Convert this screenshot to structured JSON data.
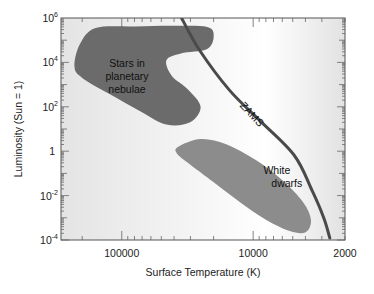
{
  "chart_data": {
    "type": "scatter",
    "title": "",
    "xlabel": "Surface Temperature   (K)",
    "ylabel": "Luminosity   (Sun = 1)",
    "xscale": "log",
    "yscale": "log",
    "x_reversed": true,
    "xlim": [
      290000,
      2000
    ],
    "ylim": [
      0.0001,
      1000000
    ],
    "x_ticks": [
      {
        "value": 100000,
        "label": "100000"
      },
      {
        "value": 10000,
        "label": "10000"
      },
      {
        "value": 2000,
        "label": "2000"
      }
    ],
    "y_ticks": [
      {
        "value": 1000000,
        "base": "10",
        "exp": "6"
      },
      {
        "value": 10000,
        "base": "10",
        "exp": "4"
      },
      {
        "value": 100,
        "base": "10",
        "exp": "2"
      },
      {
        "value": 1,
        "base": "1",
        "exp": ""
      },
      {
        "value": 0.01,
        "base": "10",
        "exp": "-2"
      },
      {
        "value": 0.0001,
        "base": "10",
        "exp": "-4"
      }
    ],
    "grid": false,
    "colors": {
      "planetary_nebulae": "#6b6b6b",
      "white_dwarfs": "#8c8c8c",
      "zams": "#4a4a4a",
      "background_edge": "#e6e6e6",
      "background_center": "#ffffff"
    },
    "regions": [
      {
        "name": "Stars in planetary nebulae",
        "label_lines": [
          "Stars in",
          "planetary",
          "nebulae"
        ],
        "label_at": [
          4.96,
          3.2
        ],
        "outline_logT_logL": [
          [
            5.2,
            5.55
          ],
          [
            4.9,
            5.62
          ],
          [
            4.6,
            5.65
          ],
          [
            4.35,
            5.6
          ],
          [
            4.3,
            5.2
          ],
          [
            4.35,
            4.6
          ],
          [
            4.55,
            4.4
          ],
          [
            4.66,
            4.1
          ],
          [
            4.62,
            3.4
          ],
          [
            4.5,
            2.8
          ],
          [
            4.4,
            2.0
          ],
          [
            4.48,
            1.3
          ],
          [
            4.66,
            1.2
          ],
          [
            4.86,
            1.8
          ],
          [
            5.1,
            2.6
          ],
          [
            5.3,
            3.3
          ],
          [
            5.36,
            3.8
          ],
          [
            5.32,
            4.8
          ]
        ]
      },
      {
        "name": "White dwarfs",
        "label_lines": [
          "White",
          "dwarfs"
        ],
        "label_at": [
          3.82,
          -1.3
        ],
        "outline_logT_logL": [
          [
            4.57,
            0.2
          ],
          [
            4.4,
            0.55
          ],
          [
            4.2,
            0.3
          ],
          [
            3.98,
            -0.4
          ],
          [
            3.78,
            -1.3
          ],
          [
            3.62,
            -2.3
          ],
          [
            3.56,
            -3.1
          ],
          [
            3.6,
            -3.65
          ],
          [
            3.72,
            -3.6
          ],
          [
            3.9,
            -3.1
          ],
          [
            4.1,
            -2.3
          ],
          [
            4.3,
            -1.4
          ],
          [
            4.48,
            -0.6
          ],
          [
            4.58,
            -0.1
          ]
        ]
      }
    ],
    "series": [
      {
        "name": "ZAMS",
        "label": "ZAMS",
        "label_at": [
          4.03,
          1.55
        ],
        "points_logT_logL": [
          [
            4.545,
            6.0
          ],
          [
            4.409,
            4.56
          ],
          [
            4.182,
            2.76
          ],
          [
            3.955,
            1.41
          ],
          [
            3.689,
            -0.17
          ],
          [
            3.553,
            -1.75
          ],
          [
            3.462,
            -3.01
          ],
          [
            3.417,
            -3.91
          ]
        ]
      }
    ]
  }
}
